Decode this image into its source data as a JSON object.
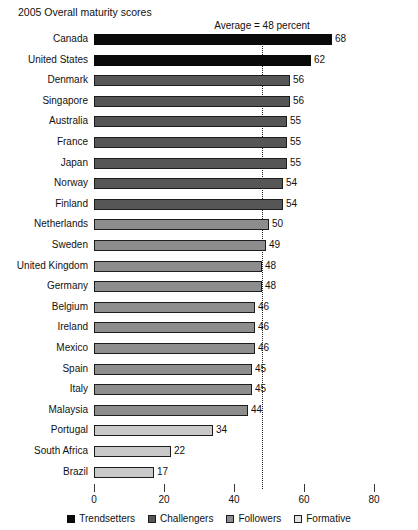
{
  "chart_data": {
    "type": "bar",
    "orientation": "horizontal",
    "title": "2005 Overall maturity scores",
    "xlabel": "",
    "ylabel": "",
    "xlim": [
      0,
      80
    ],
    "xticks": [
      0,
      20,
      40,
      60,
      80
    ],
    "grid": false,
    "legend_position": "bottom",
    "annotation": {
      "text": "Average = 48 percent",
      "value": 48,
      "style": "dotted-vertical-line"
    },
    "categories": [
      "Canada",
      "United States",
      "Denmark",
      "Singapore",
      "Australia",
      "France",
      "Japan",
      "Norway",
      "Finland",
      "Netherlands",
      "Sweden",
      "United Kingdom",
      "Germany",
      "Belgium",
      "Ireland",
      "Mexico",
      "Spain",
      "Italy",
      "Malaysia",
      "Portugal",
      "South Africa",
      "Brazil"
    ],
    "values": [
      68,
      62,
      56,
      56,
      55,
      55,
      55,
      54,
      54,
      50,
      49,
      48,
      48,
      46,
      46,
      46,
      45,
      45,
      44,
      34,
      22,
      17
    ],
    "groups": [
      "trendsetters",
      "trendsetters",
      "challengers",
      "challengers",
      "challengers",
      "challengers",
      "challengers",
      "challengers",
      "challengers",
      "followers",
      "followers",
      "followers",
      "followers",
      "followers",
      "followers",
      "followers",
      "followers",
      "followers",
      "followers",
      "formative",
      "formative",
      "formative"
    ],
    "legend": [
      {
        "key": "trendsetters",
        "label": "Trendsetters",
        "color": "#0a0a0a"
      },
      {
        "key": "challengers",
        "label": "Challengers",
        "color": "#565656"
      },
      {
        "key": "followers",
        "label": "Followers",
        "color": "#8d8d8d"
      },
      {
        "key": "formative",
        "label": "Formative",
        "color": "#e2e2e2"
      }
    ]
  }
}
